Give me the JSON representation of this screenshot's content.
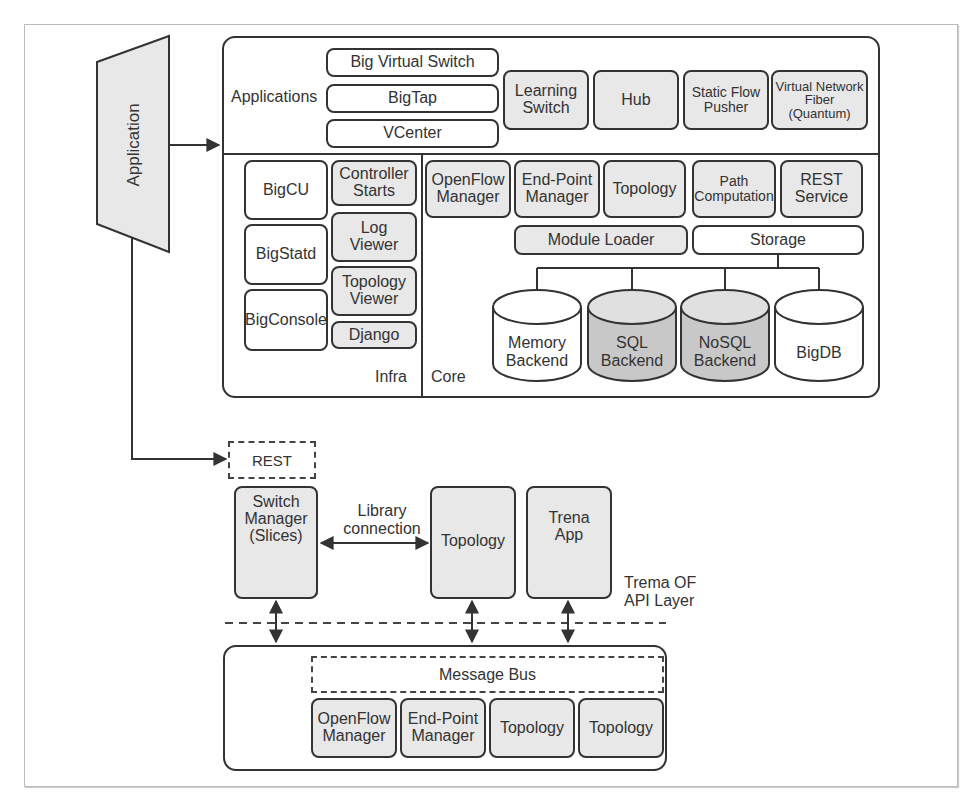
{
  "application_block": {
    "label": "Application"
  },
  "floodlight": {
    "applications": {
      "label": "Applications",
      "stacked": [
        "Big Virtual Switch",
        "BigTap",
        "VCenter"
      ],
      "modules": [
        "Learning\nSwitch",
        "Hub",
        "Static Flow\nPusher",
        "Virtual Network\nFiber (Quantum)"
      ]
    },
    "infra": {
      "label": "Infra",
      "left": [
        "BigCU",
        "BigStatd",
        "BigConsole"
      ],
      "right": [
        "Controller\nStarts",
        "Log\nViewer",
        "Topology\nViewer",
        "Django"
      ]
    },
    "core": {
      "label": "Core",
      "modules": [
        "OpenFlow\nManager",
        "End-Point\nManager",
        "Topology",
        "Path\nComputation",
        "REST\nService"
      ],
      "module_loader": "Module Loader",
      "storage": "Storage",
      "backends": [
        {
          "label": "Memory\nBackend",
          "shaded": false
        },
        {
          "label": "SQL\nBackend",
          "shaded": true
        },
        {
          "label": "NoSQL\nBackend",
          "shaded": true
        },
        {
          "label": "BigDB",
          "shaded": false
        }
      ]
    }
  },
  "trema": {
    "rest": "REST",
    "apps": [
      "Switch\nManager\n(Slices)",
      "Topology",
      "Trena\nApp"
    ],
    "library_connection": "Library\nconnection",
    "api_layer": "Trema OF\nAPI Layer",
    "message_bus": "Message Bus",
    "bus_modules": [
      "OpenFlow\nManager",
      "End-Point\nManager",
      "Topology",
      "Topology"
    ]
  },
  "colors": {
    "stroke": "#333333",
    "shade": "#e8e8e8",
    "dark_shade": "#c8c8c8",
    "frame": "#bbbbbb"
  }
}
